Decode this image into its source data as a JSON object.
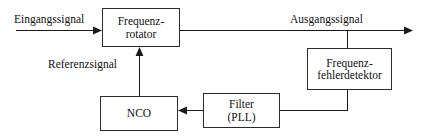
{
  "diagram": {
    "blocks": [
      {
        "id": "frequenzrotator",
        "line1": "Frequenz-",
        "line2": "rotator"
      },
      {
        "id": "frequenzfehlerdetektor",
        "line1": "Frequenz-",
        "line2": "fehlerdetektor"
      },
      {
        "id": "nco",
        "line1": "NCO",
        "line2": ""
      },
      {
        "id": "filter_pll",
        "line1": "Filter",
        "line2": "(PLL)"
      }
    ],
    "labels": {
      "eingangssignal": "Eingangssignal",
      "ausgangssignal": "Ausgangssignal",
      "referenzsignal": "Referenzsignal"
    },
    "colors": {
      "background": "#ffffff",
      "line": "#1a1a1a",
      "block_border": "#2b2b2b",
      "text": "#111111"
    },
    "connections": [
      {
        "from": "eingang",
        "to": "frequenzrotator",
        "direction": "right"
      },
      {
        "from": "frequenzrotator",
        "to": "ausgang",
        "direction": "right"
      },
      {
        "from": "ausgang_tap",
        "to": "frequenzfehlerdetektor",
        "direction": "down"
      },
      {
        "from": "frequenzfehlerdetektor",
        "to": "filter_pll",
        "direction": "left"
      },
      {
        "from": "filter_pll",
        "to": "nco",
        "direction": "left"
      },
      {
        "from": "nco",
        "to": "frequenzrotator",
        "direction": "up"
      }
    ]
  }
}
